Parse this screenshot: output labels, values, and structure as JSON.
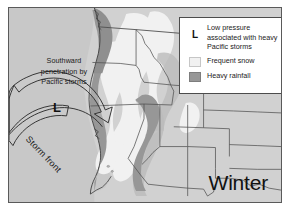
{
  "figure": {
    "season_label": "Winter",
    "annotations": {
      "southward_note": "Southward penetration by Pacific storms",
      "southward_note_lines": [
        "Southward",
        "penetration by",
        "Pacific storms"
      ],
      "low_marker": "L",
      "storm_front": "Storm front"
    }
  },
  "legend": {
    "items": [
      {
        "key": "L",
        "key_type": "letter",
        "label": "Low pressure associated with heavy Pacific storms",
        "label_lines": [
          "Low pressure",
          "associated with heavy",
          "Pacific storms"
        ]
      },
      {
        "key": "",
        "key_type": "swatch",
        "swatch_color": "#f1f1f1",
        "label": "Frequent snow",
        "label_lines": [
          "Frequent snow"
        ]
      },
      {
        "key": "",
        "key_type": "swatch",
        "swatch_color": "#979797",
        "label": "Heavy rainfall",
        "label_lines": [
          "Heavy rainfall"
        ]
      }
    ]
  },
  "colors": {
    "page_background": "#ffffff",
    "map_background": "#cbcbcb",
    "land_fill": "#d1d1d1",
    "ocean_fill": "#c6c6c6",
    "frequent_snow": "#f1f1f1",
    "heavy_rainfall": "#979797",
    "mid_shade": "#b6b6b6",
    "border_line": "#5a5a5a",
    "state_line": "#4f4f4f",
    "text": "#1a1a1a"
  },
  "map": {
    "region": "Western United States",
    "features": [
      "coastline",
      "state-boundaries",
      "frequent-snow-zone",
      "heavy-rainfall-zone",
      "storm-front-arrow",
      "low-pressure-center"
    ]
  }
}
